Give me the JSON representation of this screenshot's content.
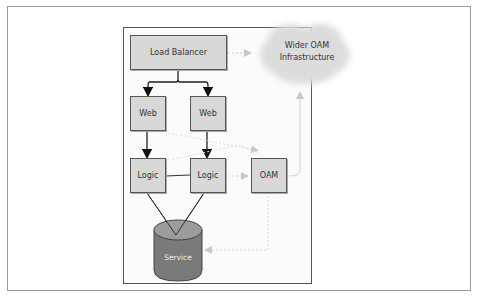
{
  "diagram": {
    "nodes": {
      "load_balancer": "Load Balancer",
      "wider_oam": [
        "Wider OAM",
        "Infrastructure"
      ],
      "web_1": "Web",
      "web_2": "Web",
      "logic_1": "Logic",
      "logic_2": "Logic",
      "oam": "OAM",
      "service": "Service"
    },
    "edges": [
      {
        "from": "Load Balancer",
        "to": "Web (left)",
        "style": "solid-arrow"
      },
      {
        "from": "Load Balancer",
        "to": "Web (right)",
        "style": "solid-arrow"
      },
      {
        "from": "Web (left)",
        "to": "Logic (left)",
        "style": "solid-arrow"
      },
      {
        "from": "Web (right)",
        "to": "Logic (right)",
        "style": "solid-arrow"
      },
      {
        "from": "Logic (left)",
        "to": "Logic (right)",
        "style": "solid-line"
      },
      {
        "from": "Logic (left)",
        "to": "Service",
        "style": "solid-line"
      },
      {
        "from": "Logic (right)",
        "to": "Service",
        "style": "solid-line"
      },
      {
        "from": "Load Balancer",
        "to": "Wider OAM Infrastructure",
        "style": "gray-arrow"
      },
      {
        "from": "OAM",
        "to": "Wider OAM Infrastructure",
        "style": "gray-arrow"
      },
      {
        "from": "Logic (right)",
        "to": "OAM",
        "style": "gray-dashed-arrow"
      },
      {
        "from": "Web",
        "to": "OAM",
        "style": "gray-dashed-arrow"
      },
      {
        "from": "OAM",
        "to": "Service",
        "style": "gray-dashed-arrow"
      }
    ],
    "colors": {
      "box_fill": "#d8d8d8",
      "box_border": "#555555",
      "cloud_fill": "#dcdcdc",
      "cylinder_top": "#9a9a9a",
      "cylinder_body": "#7a7a7a",
      "gray_connector": "#c8c8c8"
    }
  }
}
